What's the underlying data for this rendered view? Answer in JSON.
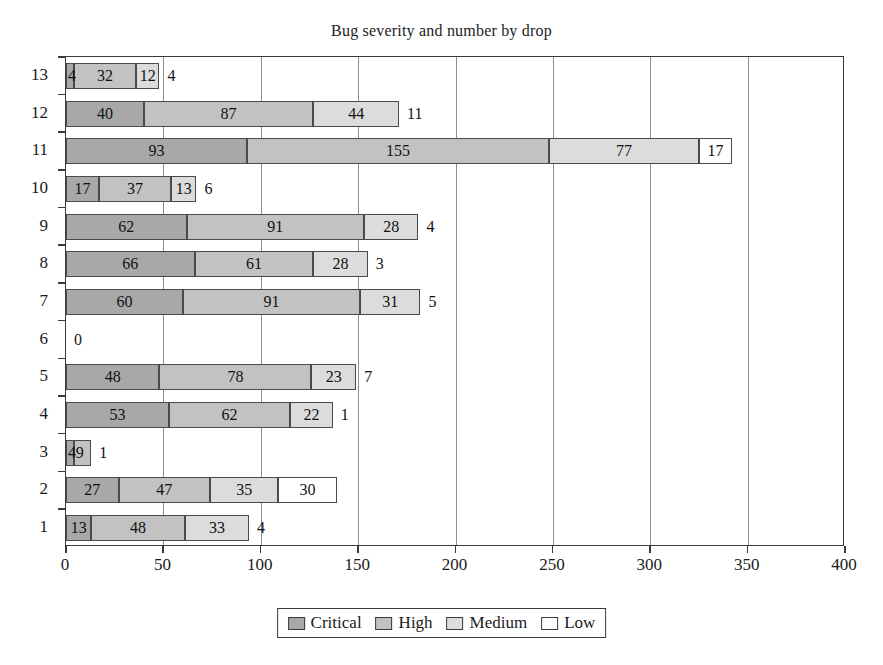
{
  "chart_data": {
    "type": "bar",
    "orientation": "horizontal",
    "stacked": true,
    "title": "Bug severity and number by drop",
    "xlabel": "",
    "ylabel": "",
    "xlim": [
      0,
      400
    ],
    "ylim": [
      0.5,
      13.5
    ],
    "xticks": [
      0,
      50,
      100,
      150,
      200,
      250,
      300,
      350,
      400
    ],
    "grid": "vertical",
    "legend_position": "bottom-center",
    "categories": [
      "1",
      "2",
      "3",
      "4",
      "5",
      "6",
      "7",
      "8",
      "9",
      "10",
      "11",
      "12",
      "13"
    ],
    "series": [
      {
        "name": "Critical",
        "color": "#a8a8a8",
        "values": [
          13,
          27,
          4,
          53,
          48,
          0,
          60,
          66,
          62,
          17,
          93,
          40,
          4
        ]
      },
      {
        "name": "High",
        "color": "#c2c2c2",
        "values": [
          48,
          47,
          9,
          62,
          78,
          0,
          91,
          61,
          91,
          37,
          155,
          87,
          32
        ]
      },
      {
        "name": "Medium",
        "color": "#dcdcdc",
        "values": [
          33,
          35,
          0,
          22,
          23,
          0,
          31,
          28,
          28,
          13,
          77,
          44,
          12
        ]
      },
      {
        "name": "Low",
        "color": "#ffffff",
        "values": [
          4,
          30,
          1,
          1,
          7,
          0,
          5,
          3,
          4,
          6,
          17,
          11,
          4
        ]
      }
    ],
    "rows": [
      {
        "drop": "13",
        "critical": 4,
        "high": 32,
        "medium": 12,
        "low": 4,
        "total": 52
      },
      {
        "drop": "12",
        "critical": 40,
        "high": 87,
        "medium": 44,
        "low": 11,
        "total": 182
      },
      {
        "drop": "11",
        "critical": 93,
        "high": 155,
        "medium": 77,
        "low": 17,
        "total": 342
      },
      {
        "drop": "10",
        "critical": 17,
        "high": 37,
        "medium": 13,
        "low": 6,
        "total": 73
      },
      {
        "drop": "9",
        "critical": 62,
        "high": 91,
        "medium": 28,
        "low": 4,
        "total": 185
      },
      {
        "drop": "8",
        "critical": 66,
        "high": 61,
        "medium": 28,
        "low": 3,
        "total": 158
      },
      {
        "drop": "7",
        "critical": 60,
        "high": 91,
        "medium": 31,
        "low": 5,
        "total": 187
      },
      {
        "drop": "6",
        "critical": 0,
        "high": 0,
        "medium": 0,
        "low": 0,
        "total": 0
      },
      {
        "drop": "5",
        "critical": 48,
        "high": 78,
        "medium": 23,
        "low": 7,
        "total": 156
      },
      {
        "drop": "4",
        "critical": 53,
        "high": 62,
        "medium": 22,
        "low": 1,
        "total": 138
      },
      {
        "drop": "3",
        "critical": 4,
        "high": 9,
        "medium": 0,
        "low": 1,
        "total": 14
      },
      {
        "drop": "2",
        "critical": 27,
        "high": 47,
        "medium": 35,
        "low": 30,
        "total": 139
      },
      {
        "drop": "1",
        "critical": 13,
        "high": 48,
        "medium": 33,
        "low": 4,
        "total": 98
      }
    ],
    "legend": [
      {
        "label": "Critical",
        "color": "#a8a8a8"
      },
      {
        "label": "High",
        "color": "#c2c2c2"
      },
      {
        "label": "Medium",
        "color": "#dcdcdc"
      },
      {
        "label": "Low",
        "color": "#ffffff"
      }
    ]
  }
}
